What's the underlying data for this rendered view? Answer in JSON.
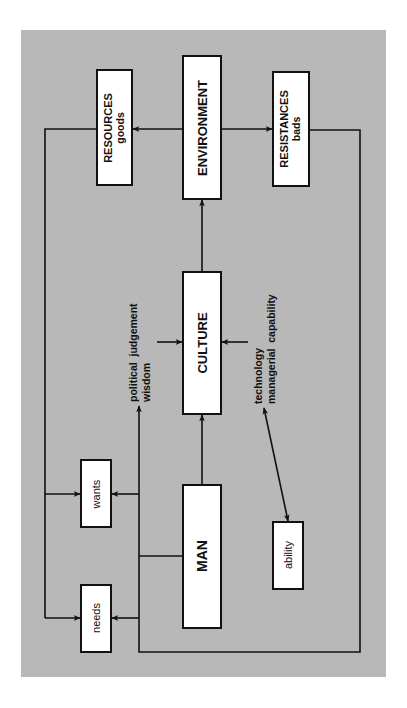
{
  "diagram": {
    "title": "",
    "colors": {
      "background": "#b8b8b8",
      "box_fill": "#ffffff",
      "stroke": "#111111"
    },
    "nodes": {
      "environment": {
        "label": "ENVIRONMENT"
      },
      "resources": {
        "label": "RESOURCES",
        "sublabel": "goods"
      },
      "resistances": {
        "label": "RESISTANCES",
        "sublabel": "bads"
      },
      "culture": {
        "label": "CULTURE"
      },
      "man": {
        "label": "MAN"
      },
      "wants": {
        "label": "wants"
      },
      "needs": {
        "label": "needs"
      },
      "ability": {
        "label": "ability"
      }
    },
    "annotations": {
      "political": {
        "line1": "political  judgement",
        "line2": "wisdom"
      },
      "technology": {
        "line1": "technology",
        "line2": "managerial  capability"
      }
    },
    "edges": [
      {
        "from": "environment",
        "to": "resources",
        "type": "arrow"
      },
      {
        "from": "environment",
        "to": "resistances",
        "type": "arrow"
      },
      {
        "from": "culture",
        "to": "environment",
        "type": "arrow"
      },
      {
        "from": "man",
        "to": "culture",
        "type": "arrow"
      },
      {
        "from": "political",
        "to": "culture",
        "type": "arrow"
      },
      {
        "from": "technology",
        "to": "culture",
        "type": "arrow"
      },
      {
        "from": "ability",
        "to": "technology",
        "type": "double-arrow"
      },
      {
        "from": "man",
        "to": "political",
        "type": "arrow"
      },
      {
        "from": "resources",
        "to": "wants",
        "type": "arrow"
      },
      {
        "from": "resources",
        "to": "needs",
        "type": "arrow"
      },
      {
        "from": "man",
        "to": "wants",
        "type": "arrow"
      },
      {
        "from": "man",
        "to": "needs",
        "type": "arrow"
      },
      {
        "from": "resistances",
        "to": "needs",
        "type": "arrow"
      },
      {
        "from": "resistances",
        "to": "wants",
        "type": "arrow"
      }
    ]
  }
}
